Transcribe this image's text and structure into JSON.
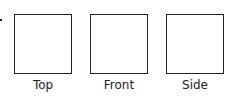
{
  "diagram": {
    "views": [
      {
        "label": "Top"
      },
      {
        "label": "Front"
      },
      {
        "label": "Side"
      }
    ],
    "stroke_color": "#222222"
  }
}
